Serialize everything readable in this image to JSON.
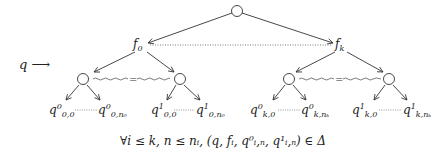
{
  "diagram": {
    "input_label": "q ⟶",
    "function_nodes": [
      {
        "id": "f0",
        "label": "f",
        "sub": "0"
      },
      {
        "id": "fk",
        "label": "f",
        "sub": "k"
      }
    ],
    "leaves": [
      {
        "base": "q",
        "sup": "0",
        "sub": "0,0"
      },
      {
        "base": "q",
        "sup": "0",
        "sub": "0,n₀"
      },
      {
        "base": "q",
        "sup": "1",
        "sub": "0,0"
      },
      {
        "base": "q",
        "sup": "1",
        "sub": "0,n₀"
      },
      {
        "base": "q",
        "sup": "0",
        "sub": "k,0"
      },
      {
        "base": "q",
        "sup": "0",
        "sub": "k,nₖ"
      },
      {
        "base": "q",
        "sup": "1",
        "sub": "k,0"
      },
      {
        "base": "q",
        "sup": "1",
        "sub": "k,nₖ"
      }
    ],
    "equality_symbol": "=",
    "formula": "∀i ≤ k, n ≤ nᵢ, (q, fᵢ, q⁰ᵢ,ₙ, q¹ᵢ,ₙ) ∈ Δ"
  }
}
